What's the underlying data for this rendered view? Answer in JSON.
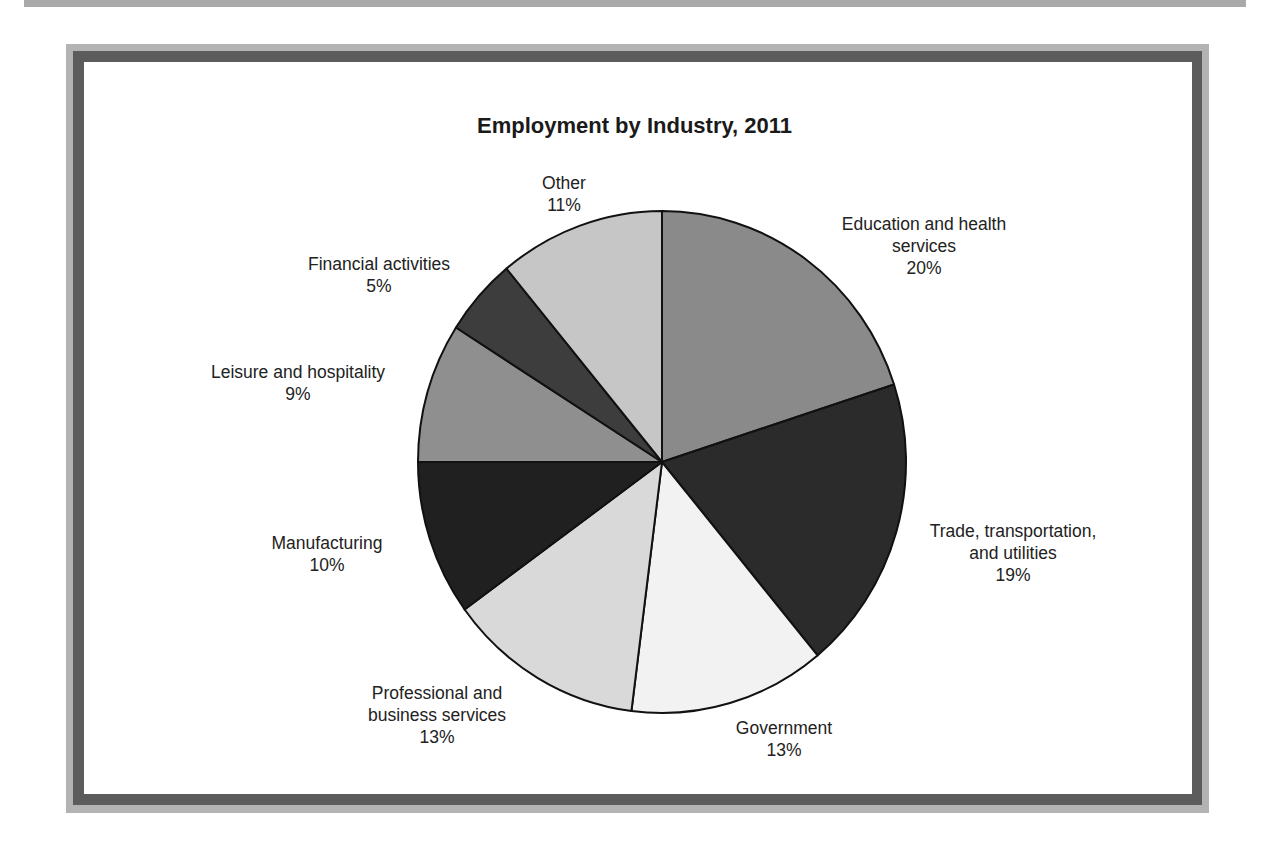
{
  "chart_data": {
    "type": "pie",
    "title": "Employment by Industry, 2011",
    "start_angle_deg": 0,
    "direction": "clockwise",
    "center": [
      662,
      462
    ],
    "radius": [
      244,
      251
    ],
    "slices": [
      {
        "label": "Education and health services",
        "label_lines": [
          "Education and health",
          "services",
          "20%"
        ],
        "value": 20,
        "color": "#8a8a8a",
        "label_pos": [
          924,
          213
        ]
      },
      {
        "label": "Trade, transportation, and utilities",
        "label_lines": [
          "Trade, transportation,",
          "and utilities",
          "19%"
        ],
        "value": 19,
        "color": "#2b2b2b",
        "label_pos": [
          1013,
          520
        ]
      },
      {
        "label": "Government",
        "label_lines": [
          "Government",
          "13%"
        ],
        "value": 13,
        "color": "#f2f2f2",
        "label_pos": [
          784,
          717
        ]
      },
      {
        "label": "Professional and business services",
        "label_lines": [
          "Professional and",
          "business services",
          "13%"
        ],
        "value": 13,
        "color": "#d9d9d9",
        "label_pos": [
          437,
          682
        ]
      },
      {
        "label": "Manufacturing",
        "label_lines": [
          "Manufacturing",
          "10%"
        ],
        "value": 10,
        "color": "#202020",
        "label_pos": [
          327,
          532
        ]
      },
      {
        "label": "Leisure and hospitality",
        "label_lines": [
          "Leisure and hospitality",
          "9%"
        ],
        "value": 9,
        "color": "#8f8f8f",
        "label_pos": [
          298,
          361
        ]
      },
      {
        "label": "Financial activities",
        "label_lines": [
          "Financial activities",
          "5%"
        ],
        "value": 5,
        "color": "#3d3d3d",
        "label_pos": [
          379,
          253
        ]
      },
      {
        "label": "Other",
        "label_lines": [
          "Other",
          "11%"
        ],
        "value": 11,
        "color": "#c6c6c6",
        "label_pos": [
          564,
          172
        ]
      }
    ]
  },
  "frame": {
    "accent_outer": "#b3b3b3",
    "accent_inner": "#5c5c5c"
  }
}
